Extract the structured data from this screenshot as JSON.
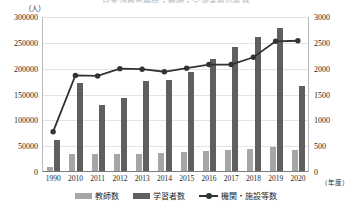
{
  "chart_data": {
    "type": "bar",
    "title": "日本語教育機関・教師・学習者数の推移",
    "xlabel": "（年度）",
    "ylabel": "（人）",
    "categories": [
      "1990",
      "2010",
      "2011",
      "2012",
      "2013",
      "2014",
      "2015",
      "2016",
      "2017",
      "2018",
      "2019",
      "2020"
    ],
    "ylim": [
      0,
      300000
    ],
    "y_ticks": [
      "0",
      "50000",
      "100000",
      "150000",
      "200000",
      "250000",
      "300000"
    ],
    "ylim_secondary": [
      0,
      3000
    ],
    "y_ticks_secondary": [
      "0",
      "500",
      "1000",
      "1500",
      "2000",
      "2500",
      "3000"
    ],
    "grid": true,
    "legend_position": "bottom",
    "series": [
      {
        "name": "教師数",
        "type": "bar",
        "axis": "left",
        "color": "#a6a6a6",
        "values": [
          8000,
          33000,
          32000,
          32000,
          33000,
          34000,
          37000,
          39000,
          40000,
          42000,
          46000,
          40000
        ]
      },
      {
        "name": "学習者数",
        "type": "bar",
        "axis": "left",
        "color": "#5f5f5f",
        "values": [
          60000,
          171000,
          128000,
          141000,
          174000,
          176000,
          192000,
          217000,
          240000,
          259000,
          277000,
          165000
        ]
      },
      {
        "name": "機関・施設等数",
        "type": "line",
        "axis": "right",
        "color": "#333333",
        "values": [
          780,
          1870,
          1860,
          2000,
          1990,
          1940,
          2010,
          2080,
          2080,
          2220,
          2530,
          2540
        ]
      }
    ]
  },
  "axis": {
    "left_unit": "（人）",
    "right_unit": "",
    "x_unit": "（年度）"
  },
  "legend": {
    "items": [
      {
        "label": "教師数",
        "marker": "swatch-light"
      },
      {
        "label": "学習者数",
        "marker": "swatch-dark"
      },
      {
        "label": "機関・施設等数",
        "marker": "line-marker"
      }
    ]
  }
}
